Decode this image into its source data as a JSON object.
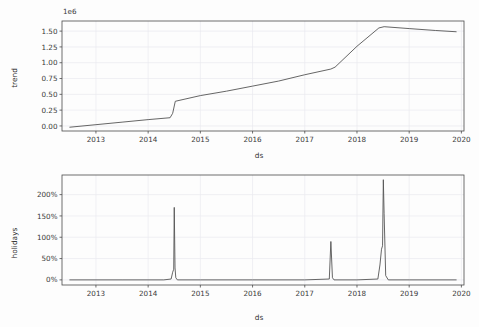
{
  "figure": {
    "background_color": "#fdfdfd",
    "line_color": "#555555",
    "grid_color": "#e9e9ef",
    "axis_color": "#4a4a4a"
  },
  "chart_data": [
    {
      "type": "line",
      "name": "trend-component",
      "title": "",
      "xlabel": "ds",
      "ylabel": "trend",
      "y_offset_text": "1e6",
      "grid": true,
      "legend": "none",
      "xlim": [
        2012.35,
        2020.05
      ],
      "ylim": [
        -0.08,
        1.66
      ],
      "xticks": [
        "2013",
        "2014",
        "2015",
        "2016",
        "2017",
        "2018",
        "2019",
        "2020"
      ],
      "xtick_values": [
        2013,
        2014,
        2015,
        2016,
        2017,
        2018,
        2019,
        2020
      ],
      "yticks": [
        "0.00",
        "0.25",
        "0.50",
        "0.75",
        "1.00",
        "1.25",
        "1.50"
      ],
      "ytick_values": [
        0.0,
        0.25,
        0.5,
        0.75,
        1.0,
        1.25,
        1.5
      ],
      "series": [
        {
          "name": "trend",
          "x": [
            2012.5,
            2013.0,
            2013.5,
            2014.0,
            2014.42,
            2014.47,
            2014.52,
            2015.0,
            2015.5,
            2016.0,
            2016.5,
            2017.0,
            2017.5,
            2017.58,
            2018.0,
            2018.42,
            2018.52,
            2019.0,
            2019.5,
            2019.9
          ],
          "y": [
            -0.02,
            0.02,
            0.06,
            0.1,
            0.13,
            0.2,
            0.39,
            0.48,
            0.55,
            0.63,
            0.71,
            0.81,
            0.9,
            0.93,
            1.26,
            1.55,
            1.57,
            1.54,
            1.51,
            1.49
          ]
        }
      ]
    },
    {
      "type": "line",
      "name": "holidays-component",
      "title": "",
      "xlabel": "ds",
      "ylabel": "holidays",
      "grid": true,
      "legend": "none",
      "xlim": [
        2012.35,
        2020.05
      ],
      "ylim": [
        -0.12,
        2.46
      ],
      "xticks": [
        "2013",
        "2014",
        "2015",
        "2016",
        "2017",
        "2018",
        "2019",
        "2020"
      ],
      "xtick_values": [
        2013,
        2014,
        2015,
        2016,
        2017,
        2018,
        2019,
        2020
      ],
      "yticks": [
        "0%",
        "50%",
        "100%",
        "150%",
        "200%"
      ],
      "ytick_values": [
        0.0,
        0.5,
        1.0,
        1.5,
        2.0
      ],
      "series": [
        {
          "name": "holidays",
          "x": [
            2012.5,
            2013.5,
            2014.3,
            2014.44,
            2014.47,
            2014.49,
            2014.5,
            2014.515,
            2014.53,
            2014.56,
            2015.0,
            2016.0,
            2017.0,
            2017.47,
            2017.5,
            2017.53,
            2017.56,
            2018.0,
            2018.4,
            2018.44,
            2018.47,
            2018.49,
            2018.505,
            2018.52,
            2018.55,
            2018.6,
            2019.0,
            2019.9
          ],
          "y": [
            0.0,
            0.0,
            0.0,
            0.02,
            0.18,
            0.25,
            1.7,
            0.28,
            0.05,
            0.0,
            0.0,
            0.0,
            0.0,
            0.02,
            0.9,
            0.05,
            0.0,
            0.0,
            0.02,
            0.35,
            0.72,
            0.8,
            2.35,
            1.55,
            0.1,
            0.0,
            0.0,
            0.0
          ]
        }
      ],
      "annotations": [
        {
          "label": "spike-2014",
          "x": 2014.5,
          "y": 1.7
        },
        {
          "label": "spike-2017",
          "x": 2017.5,
          "y": 0.9
        },
        {
          "label": "spike-2018",
          "x": 2018.5,
          "y": 2.35
        }
      ]
    }
  ]
}
